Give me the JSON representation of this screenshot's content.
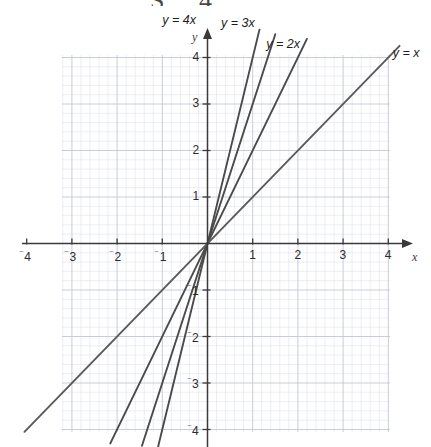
{
  "artifact": {
    "top_text": "S 4"
  },
  "chart_data": {
    "type": "line",
    "title": "",
    "xlabel": "x",
    "ylabel": "y",
    "xlim": [
      -4.3,
      4.3
    ],
    "ylim": [
      -4.3,
      4.45
    ],
    "grid": true,
    "minor_grid": true,
    "grid_step_minor": 0.2,
    "grid_step_major": 1,
    "legend": "inline-annotations",
    "axis_arrows": [
      "x-positive",
      "y-positive"
    ],
    "x_ticks": [
      -4,
      -3,
      -2,
      -1,
      1,
      2,
      3,
      4
    ],
    "y_ticks": [
      -4,
      -3,
      -2,
      -1,
      1,
      2,
      3,
      4
    ],
    "x_tick_labels": [
      "⁻4",
      "⁻3",
      "⁻2",
      "⁻1",
      "1",
      "2",
      "3",
      "4"
    ],
    "y_tick_labels": [
      "⁻4",
      "⁻3",
      "⁻2",
      "⁻1",
      "1",
      "2",
      "3",
      "4"
    ],
    "series": [
      {
        "name": "y = 4x",
        "label": "y = 4x",
        "slope": 4,
        "intercept": 0,
        "color": "#4a4a4a",
        "x": [
          -1.1,
          1.15
        ],
        "values": [
          -4.4,
          4.6
        ],
        "label_x": -1.0,
        "label_y": 4.95
      },
      {
        "name": "y = 3x",
        "label": "y = 3x",
        "slope": 3,
        "intercept": 0,
        "color": "#4a4a4a",
        "x": [
          -1.45,
          1.5
        ],
        "values": [
          -4.35,
          4.5
        ],
        "label_x": 0.3,
        "label_y": 4.9
      },
      {
        "name": "y = 2x",
        "label": "y = 2x",
        "slope": 2,
        "intercept": 0,
        "color": "#4a4a4a",
        "x": [
          -2.15,
          2.2
        ],
        "values": [
          -4.3,
          4.4
        ],
        "label_x": 1.3,
        "label_y": 4.45
      },
      {
        "name": "y = x",
        "label": "y = x",
        "slope": 1,
        "intercept": 0,
        "color": "#5a5a5a",
        "x": [
          -4.05,
          4.25
        ],
        "values": [
          -4.05,
          4.25
        ],
        "label_x": 4.1,
        "label_y": 4.25
      }
    ],
    "colors": {
      "grid_minor": "#dfe3ec",
      "grid_major": "#c2c8d4",
      "axis": "#3a3a3a",
      "line": "#4a4a4a",
      "text": "#2b2b2b",
      "background": "#ffffff"
    }
  }
}
